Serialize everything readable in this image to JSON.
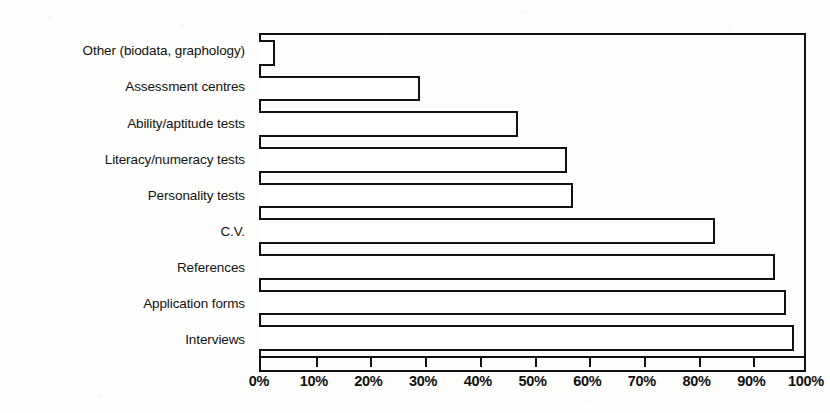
{
  "chart_data": {
    "type": "bar",
    "orientation": "horizontal",
    "title": "",
    "subtitle": "",
    "xlabel": "",
    "ylabel": "",
    "xlim": [
      0,
      100
    ],
    "xtick_labels": [
      "0%",
      "10%",
      "20%",
      "30%",
      "40%",
      "50%",
      "60%",
      "70%",
      "80%",
      "90%",
      "100%"
    ],
    "xtick_values": [
      0,
      10,
      20,
      30,
      40,
      50,
      60,
      70,
      80,
      90,
      100
    ],
    "grid": false,
    "legend": null,
    "unit": "%",
    "bar_style": {
      "fill": "#ffffff",
      "edge": "#111111",
      "edge_width_px": 2
    },
    "categories": [
      "Other (biodata, graphology)",
      "Assessment centres",
      "Ability/aptitude tests",
      "Literacy/numeracy tests",
      "Personality tests",
      "C.V.",
      "References",
      "Application forms",
      "Interviews"
    ],
    "values": [
      2.5,
      29,
      47,
      56,
      57,
      83,
      94,
      96,
      97.5
    ]
  }
}
